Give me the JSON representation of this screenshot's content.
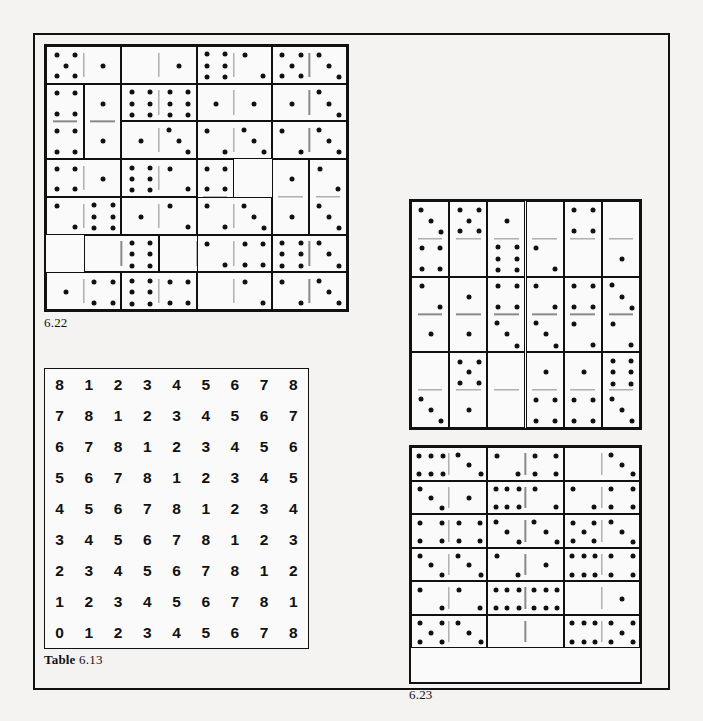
{
  "page": {
    "background_color": "#f4f3f1",
    "ink_color": "#111111"
  },
  "figures": [
    {
      "id": "fig-6-22",
      "label": "6.22",
      "type": "domino-puzzle",
      "columns": 8,
      "rows": 7,
      "note": "Solved domino dissection, 8x7 cells of pips",
      "dominoes": [
        {
          "r": 0,
          "c": 0,
          "orient": "h",
          "a": 5,
          "b": 1
        },
        {
          "r": 0,
          "c": 2,
          "orient": "h",
          "a": 0,
          "b": 1
        },
        {
          "r": 0,
          "c": 4,
          "orient": "h",
          "a": 6,
          "b": 2
        },
        {
          "r": 0,
          "c": 6,
          "orient": "h",
          "a": 5,
          "b": 3
        },
        {
          "r": 1,
          "c": 0,
          "orient": "v",
          "a": 4,
          "b": 4
        },
        {
          "r": 1,
          "c": 1,
          "orient": "v",
          "a": 1,
          "b": 1
        },
        {
          "r": 1,
          "c": 2,
          "orient": "h",
          "a": 6,
          "b": 6
        },
        {
          "r": 1,
          "c": 4,
          "orient": "h",
          "a": 1,
          "b": 1
        },
        {
          "r": 1,
          "c": 6,
          "orient": "h",
          "a": 1,
          "b": 3
        },
        {
          "r": 2,
          "c": 2,
          "orient": "h",
          "a": 1,
          "b": 3
        },
        {
          "r": 2,
          "c": 4,
          "orient": "h",
          "a": 2,
          "b": 3
        },
        {
          "r": 2,
          "c": 6,
          "orient": "h",
          "a": 2,
          "b": 3
        },
        {
          "r": 3,
          "c": 0,
          "orient": "h",
          "a": 4,
          "b": 1
        },
        {
          "r": 3,
          "c": 2,
          "orient": "h",
          "a": 6,
          "b": 2
        },
        {
          "r": 3,
          "c": 4,
          "orient": "v",
          "a": 4,
          "b": 1
        },
        {
          "r": 3,
          "c": 6,
          "orient": "v",
          "a": 1,
          "b": 1
        },
        {
          "r": 3,
          "c": 7,
          "orient": "v",
          "a": 2,
          "b": 3
        },
        {
          "r": 4,
          "c": 0,
          "orient": "h",
          "a": 2,
          "b": 6
        },
        {
          "r": 4,
          "c": 2,
          "orient": "h",
          "a": 1,
          "b": 2
        },
        {
          "r": 4,
          "c": 4,
          "orient": "h",
          "a": 2,
          "b": 3
        },
        {
          "r": 5,
          "c": 1,
          "orient": "h",
          "a": 0,
          "b": 6
        },
        {
          "r": 5,
          "c": 3,
          "orient": "h",
          "a": 0,
          "b": 0
        },
        {
          "r": 5,
          "c": 4,
          "orient": "h",
          "a": 2,
          "b": 4
        },
        {
          "r": 5,
          "c": 6,
          "orient": "h",
          "a": 6,
          "b": 3
        },
        {
          "r": 6,
          "c": 0,
          "orient": "h",
          "a": 1,
          "b": 4
        },
        {
          "r": 6,
          "c": 2,
          "orient": "h",
          "a": 6,
          "b": 4
        },
        {
          "r": 6,
          "c": 4,
          "orient": "h",
          "a": 0,
          "b": 2
        },
        {
          "r": 6,
          "c": 6,
          "orient": "h",
          "a": 2,
          "b": 3
        }
      ]
    },
    {
      "id": "fig-6-23-top",
      "label": "",
      "type": "domino-puzzle",
      "columns": 6,
      "rows": 6,
      "note": "Upper right solved domino dissection, vertical dominoes",
      "dominoes": [
        {
          "r": 0,
          "c": 0,
          "orient": "v",
          "a": 3,
          "b": 4
        },
        {
          "r": 0,
          "c": 1,
          "orient": "v",
          "a": 5,
          "b": 0
        },
        {
          "r": 0,
          "c": 2,
          "orient": "v",
          "a": 1,
          "b": 6
        },
        {
          "r": 0,
          "c": 3,
          "orient": "v",
          "a": 0,
          "b": 2
        },
        {
          "r": 0,
          "c": 4,
          "orient": "v",
          "a": 4,
          "b": 0
        },
        {
          "r": 0,
          "c": 5,
          "orient": "v",
          "a": 0,
          "b": 1
        },
        {
          "r": 2,
          "c": 0,
          "orient": "v",
          "a": 2,
          "b": 1
        },
        {
          "r": 2,
          "c": 1,
          "orient": "v",
          "a": 1,
          "b": 1
        },
        {
          "r": 2,
          "c": 2,
          "orient": "v",
          "a": 4,
          "b": 3
        },
        {
          "r": 2,
          "c": 3,
          "orient": "v",
          "a": 2,
          "b": 3
        },
        {
          "r": 2,
          "c": 4,
          "orient": "v",
          "a": 4,
          "b": 2
        },
        {
          "r": 2,
          "c": 5,
          "orient": "v",
          "a": 3,
          "b": 2
        },
        {
          "r": 4,
          "c": 0,
          "orient": "v",
          "a": 0,
          "b": 3
        },
        {
          "r": 4,
          "c": 1,
          "orient": "v",
          "a": 5,
          "b": 1
        },
        {
          "r": 4,
          "c": 2,
          "orient": "v",
          "a": 0,
          "b": 0
        },
        {
          "r": 4,
          "c": 3,
          "orient": "v",
          "a": 1,
          "b": 4
        },
        {
          "r": 4,
          "c": 4,
          "orient": "v",
          "a": 1,
          "b": 4
        },
        {
          "r": 4,
          "c": 5,
          "orient": "v",
          "a": 6,
          "b": 3
        }
      ]
    },
    {
      "id": "fig-6-23",
      "label": "6.23",
      "type": "domino-puzzle",
      "columns": 6,
      "rows": 7,
      "note": "Lower right solved domino dissection, horizontal dominoes",
      "dominoes": [
        {
          "r": 0,
          "c": 0,
          "orient": "h",
          "a": 6,
          "b": 3
        },
        {
          "r": 0,
          "c": 2,
          "orient": "h",
          "a": 2,
          "b": 4
        },
        {
          "r": 0,
          "c": 4,
          "orient": "h",
          "a": 0,
          "b": 3
        },
        {
          "r": 1,
          "c": 0,
          "orient": "h",
          "a": 3,
          "b": 1
        },
        {
          "r": 1,
          "c": 2,
          "orient": "h",
          "a": 6,
          "b": 2
        },
        {
          "r": 1,
          "c": 4,
          "orient": "h",
          "a": 2,
          "b": 4
        },
        {
          "r": 2,
          "c": 0,
          "orient": "h",
          "a": 4,
          "b": 4
        },
        {
          "r": 2,
          "c": 2,
          "orient": "h",
          "a": 3,
          "b": 3
        },
        {
          "r": 2,
          "c": 4,
          "orient": "h",
          "a": 5,
          "b": 3
        },
        {
          "r": 3,
          "c": 0,
          "orient": "h",
          "a": 3,
          "b": 3
        },
        {
          "r": 3,
          "c": 2,
          "orient": "h",
          "a": 2,
          "b": 1
        },
        {
          "r": 3,
          "c": 4,
          "orient": "h",
          "a": 6,
          "b": 4
        },
        {
          "r": 4,
          "c": 0,
          "orient": "h",
          "a": 2,
          "b": 2
        },
        {
          "r": 4,
          "c": 2,
          "orient": "h",
          "a": 6,
          "b": 6
        },
        {
          "r": 4,
          "c": 4,
          "orient": "h",
          "a": 0,
          "b": 1
        },
        {
          "r": 5,
          "c": 0,
          "orient": "h",
          "a": 5,
          "b": 3
        },
        {
          "r": 5,
          "c": 2,
          "orient": "h",
          "a": 0,
          "b": 0
        },
        {
          "r": 5,
          "c": 4,
          "orient": "h",
          "a": 6,
          "b": 5
        }
      ]
    }
  ],
  "table": {
    "id": "table-6-13",
    "caption_prefix": "Table",
    "caption_number": "6.13",
    "rows": [
      [
        "8",
        "1",
        "2",
        "3",
        "4",
        "5",
        "6",
        "7",
        "8"
      ],
      [
        "7",
        "8",
        "1",
        "2",
        "3",
        "4",
        "5",
        "6",
        "7"
      ],
      [
        "6",
        "7",
        "8",
        "1",
        "2",
        "3",
        "4",
        "5",
        "6"
      ],
      [
        "5",
        "6",
        "7",
        "8",
        "1",
        "2",
        "3",
        "4",
        "5"
      ],
      [
        "4",
        "5",
        "6",
        "7",
        "8",
        "1",
        "2",
        "3",
        "4"
      ],
      [
        "3",
        "4",
        "5",
        "6",
        "7",
        "8",
        "1",
        "2",
        "3"
      ],
      [
        "2",
        "3",
        "4",
        "5",
        "6",
        "7",
        "8",
        "1",
        "2"
      ],
      [
        "1",
        "2",
        "3",
        "4",
        "5",
        "6",
        "7",
        "8",
        "1"
      ],
      [
        "0",
        "1",
        "2",
        "3",
        "4",
        "5",
        "6",
        "7",
        "8"
      ]
    ]
  }
}
